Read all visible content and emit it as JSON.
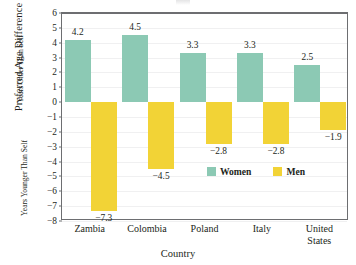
{
  "chart_data": {
    "type": "bar",
    "title": "",
    "xlabel": "Country",
    "ylabel": "Preferred Age Difference",
    "ylabel_upper": "Years Older Than Self",
    "ylabel_lower": "Years Younger Than Self",
    "ylim": [
      -8,
      6
    ],
    "yticks": [
      6,
      5,
      4,
      3,
      2,
      1,
      0,
      -1,
      -2,
      -3,
      -4,
      -5,
      -6,
      -7,
      -8
    ],
    "ytick_labels": [
      "6",
      "5",
      "4",
      "3",
      "2",
      "1",
      "0",
      "−1",
      "−2",
      "−3",
      "−4",
      "−5",
      "−6",
      "−7",
      "−8"
    ],
    "grid": true,
    "zero_line": true,
    "legend_position": "inside-lower-right",
    "categories": [
      "Zambia",
      "Colombia",
      "Poland",
      "Italy",
      "United States"
    ],
    "category_lines": [
      [
        "Zambia"
      ],
      [
        "Colombia"
      ],
      [
        "Poland"
      ],
      [
        "Italy"
      ],
      [
        "United",
        "States"
      ]
    ],
    "series": [
      {
        "name": "Women",
        "color": "#8cc9b4",
        "values": [
          4.2,
          4.5,
          3.3,
          3.3,
          2.5
        ],
        "labels": [
          "4.2",
          "4.5",
          "3.3",
          "3.3",
          "2.5"
        ]
      },
      {
        "name": "Men",
        "color": "#f2d336",
        "values": [
          -7.3,
          -4.5,
          -2.8,
          -2.8,
          -1.9
        ],
        "labels": [
          "−7.3",
          "−4.5",
          "−2.8",
          "−2.8",
          "−1.9"
        ]
      }
    ]
  },
  "colors": {
    "women": "#8cc9b4",
    "men": "#f2d336",
    "axis": "#6d6e71",
    "grid": "#f0f0f1",
    "text": "#231f20"
  },
  "legend": {
    "entries": [
      {
        "label": "Women",
        "swatch": "women"
      },
      {
        "label": "Men",
        "swatch": "men"
      }
    ]
  }
}
